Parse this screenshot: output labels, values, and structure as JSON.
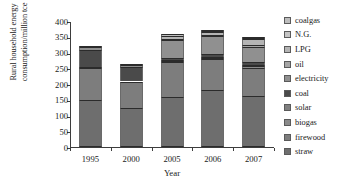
{
  "chart_data": {
    "type": "bar",
    "stacked": true,
    "title": "",
    "xlabel": "Year",
    "ylabel": "Rural household energy consumption/million tce",
    "ylabel_lines": [
      "Rural household energy",
      "consumption/million tce"
    ],
    "categories": [
      "1995",
      "2000",
      "2005",
      "2006",
      "2007"
    ],
    "ylim": [
      0,
      400
    ],
    "yticks": [
      0,
      50,
      100,
      150,
      200,
      250,
      300,
      350,
      400
    ],
    "grid": false,
    "legend_position": "right",
    "legend_order_top_to_bottom": [
      "coalgas",
      "N.G.",
      "LPG",
      "oil",
      "electricity",
      "coal",
      "solar",
      "biogas",
      "firewood",
      "straw"
    ],
    "series": [
      {
        "name": "straw",
        "color": "#6e6e6e",
        "values": [
          150,
          124,
          160,
          181,
          162
        ]
      },
      {
        "name": "firewood",
        "color": "#7d7d7d",
        "values": [
          101,
          84,
          110,
          97,
          90
        ]
      },
      {
        "name": "biogas",
        "color": "#8a8a8a",
        "values": [
          2,
          2,
          4,
          5,
          6
        ]
      },
      {
        "name": "solar",
        "color": "#808080",
        "values": [
          1,
          1,
          2,
          2,
          3
        ]
      },
      {
        "name": "coal",
        "color": "#4a4a4a",
        "values": [
          55,
          42,
          8,
          9,
          8
        ]
      },
      {
        "name": "electricity",
        "color": "#909090",
        "values": [
          8,
          7,
          55,
          57,
          50
        ]
      },
      {
        "name": "oil",
        "color": "#a5a5a5",
        "values": [
          1,
          1,
          3,
          5,
          4
        ]
      },
      {
        "name": "LPG",
        "color": "#b4b4b4",
        "values": [
          0,
          0,
          9,
          8,
          20
        ]
      },
      {
        "name": "N.G.",
        "color": "#c4c4c4",
        "values": [
          0,
          0,
          3,
          3,
          3
        ]
      },
      {
        "name": "coalgas",
        "color": "#bdbdbd",
        "values": [
          0,
          0,
          2,
          1,
          2
        ]
      }
    ],
    "totals": [
      318,
      261,
      356,
      368,
      348
    ]
  },
  "legend": {
    "items": [
      {
        "label": "coalgas"
      },
      {
        "label": "N.G."
      },
      {
        "label": "LPG"
      },
      {
        "label": "oil"
      },
      {
        "label": "electricity"
      },
      {
        "label": "coal"
      },
      {
        "label": "solar"
      },
      {
        "label": "biogas"
      },
      {
        "label": "firewood"
      },
      {
        "label": "straw"
      }
    ]
  }
}
